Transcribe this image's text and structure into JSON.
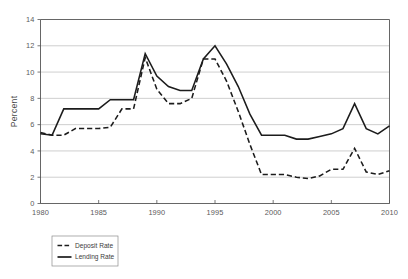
{
  "chart_data": {
    "type": "line",
    "title": "",
    "subtitle": "",
    "xlabel": "",
    "ylabel": "Percent",
    "xlim": [
      1980,
      2010
    ],
    "ylim": [
      0,
      14
    ],
    "ytick_values": [
      0,
      2,
      4,
      6,
      8,
      10,
      12,
      14
    ],
    "ytick_labels": [
      "0",
      "2",
      "4",
      "6",
      "8",
      "10",
      "12",
      "14"
    ],
    "xtick_values": [
      1980,
      1985,
      1990,
      1995,
      2000,
      2005,
      2010
    ],
    "xtick_labels": [
      "1980",
      "1985",
      "1990",
      "1995",
      "2000",
      "2005",
      "2010"
    ],
    "grid": "horizontal",
    "legend_position": "below-left",
    "x": [
      1980,
      1981,
      1982,
      1983,
      1984,
      1985,
      1986,
      1987,
      1988,
      1989,
      1990,
      1991,
      1992,
      1993,
      1994,
      1995,
      1996,
      1997,
      1998,
      1999,
      2000,
      2001,
      2002,
      2003,
      2004,
      2005,
      2006,
      2007,
      2008,
      2009,
      2010
    ],
    "series": [
      {
        "name": "Deposit Rate",
        "style": "dashed",
        "color": "#1c1c1c",
        "values": [
          5.4,
          5.2,
          5.2,
          5.7,
          5.7,
          5.7,
          5.8,
          7.2,
          7.2,
          11.1,
          8.7,
          7.6,
          7.6,
          8.0,
          11.0,
          11.0,
          9.3,
          7.0,
          4.5,
          2.2,
          2.2,
          2.2,
          2.0,
          1.9,
          2.1,
          2.6,
          2.6,
          4.2,
          2.4,
          2.2,
          2.5
        ]
      },
      {
        "name": "Lending Rate",
        "style": "solid",
        "color": "#1c1c1c",
        "values": [
          5.3,
          5.2,
          7.2,
          7.2,
          7.2,
          7.2,
          7.9,
          7.9,
          7.9,
          11.4,
          9.7,
          8.9,
          8.6,
          8.6,
          11.0,
          12.0,
          10.6,
          8.9,
          6.8,
          5.2,
          5.2,
          5.2,
          4.9,
          4.9,
          5.1,
          5.3,
          5.7,
          7.6,
          5.7,
          5.3,
          5.9
        ]
      }
    ]
  },
  "legend": {
    "entries": [
      {
        "label": "Deposit Rate",
        "marker": "dashed-line-swatch"
      },
      {
        "label": "Lending Rate",
        "marker": "solid-line-swatch"
      }
    ]
  },
  "axis": {
    "y_title": "Percent"
  }
}
